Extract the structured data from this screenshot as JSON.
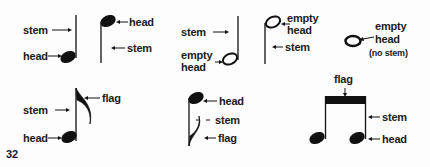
{
  "diagram": {
    "page_number": "32",
    "figures": [
      {
        "id": "quarter-stem-up",
        "labels": [
          "stem",
          "head"
        ]
      },
      {
        "id": "quarter-stem-down",
        "labels": [
          "head",
          "stem"
        ]
      },
      {
        "id": "half-stem-up",
        "labels": [
          "stem",
          "empty",
          "head"
        ]
      },
      {
        "id": "half-stem-down",
        "labels": [
          "empty",
          "head",
          "stem"
        ]
      },
      {
        "id": "whole-note",
        "labels": [
          "empty",
          "head",
          "(no stem)"
        ]
      },
      {
        "id": "eighth-stem-up",
        "labels": [
          "stem",
          "head",
          "flag"
        ]
      },
      {
        "id": "eighth-stem-down",
        "labels": [
          "head",
          "stem",
          "flag"
        ]
      },
      {
        "id": "beamed-eighths",
        "labels": [
          "flag",
          "stem",
          "head"
        ]
      }
    ]
  }
}
